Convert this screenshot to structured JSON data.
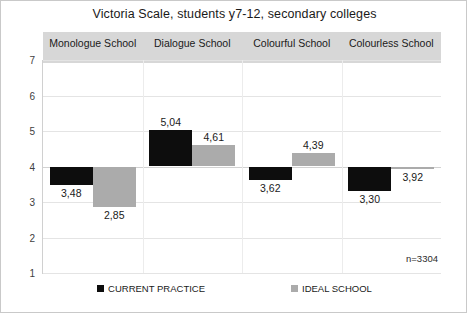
{
  "chart_data": {
    "type": "bar",
    "title": "Victoria Scale, students y7-12, secondary colleges",
    "xlabel": "",
    "ylabel": "",
    "ylim": [
      1,
      7
    ],
    "yticks": [
      1,
      2,
      3,
      4,
      5,
      6,
      7
    ],
    "baseline": 4,
    "grid": true,
    "legend_position": "bottom",
    "annotation": "n=3304",
    "decimal_separator": ",",
    "categories": [
      "Monologue School",
      "Dialogue School",
      "Colourful School",
      "Colourless School"
    ],
    "series": [
      {
        "name": "CURRENT PRACTICE",
        "color": "#0d0d0d",
        "values": [
          3.48,
          5.04,
          3.62,
          3.3
        ],
        "labels": [
          "3,48",
          "5,04",
          "3,62",
          "3,30"
        ]
      },
      {
        "name": "IDEAL SCHOOL",
        "color": "#ababab",
        "values": [
          2.85,
          4.61,
          4.39,
          3.92
        ],
        "labels": [
          "2,85",
          "4,61",
          "4,39",
          "3,92"
        ]
      }
    ]
  }
}
